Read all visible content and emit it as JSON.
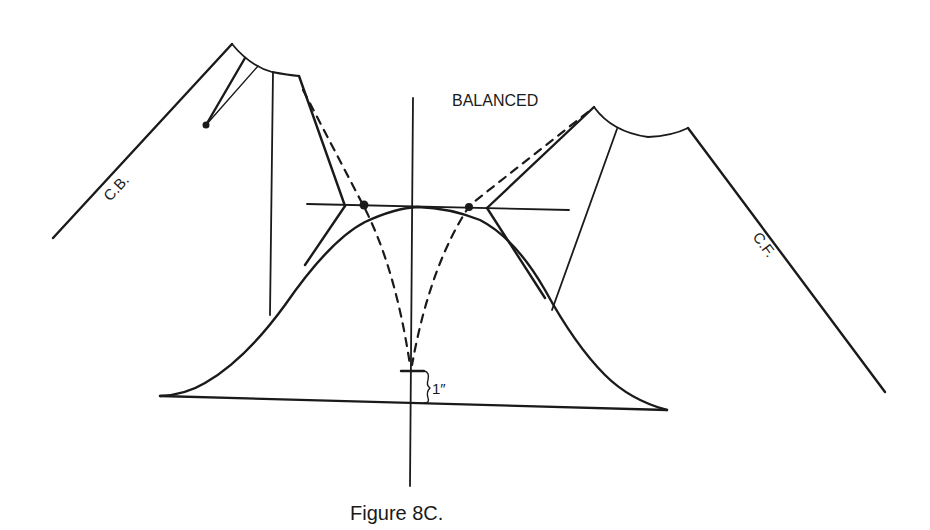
{
  "figure": {
    "caption": "Figure 8C.",
    "title_label": "BALANCED",
    "labels": {
      "center_back": "C.B.",
      "center_front": "C.F.",
      "measurement": "1″"
    }
  },
  "colors": {
    "ink": "#1a1a1a",
    "background": "#ffffff"
  }
}
